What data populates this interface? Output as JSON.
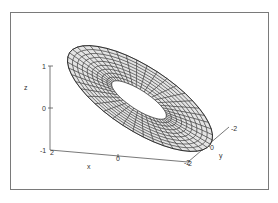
{
  "chart_data": {
    "type": "surface3d",
    "title": "",
    "xlabel": "x",
    "ylabel": "y",
    "zlabel": "z",
    "x_ticks": [
      "2",
      "0",
      "-2"
    ],
    "y_ticks": [
      "-2",
      "0",
      "2"
    ],
    "z_ticks": [
      "1",
      "0",
      "-1"
    ],
    "xlim": [
      -2,
      2
    ],
    "ylim": [
      -2,
      2
    ],
    "zlim": [
      -1,
      1
    ],
    "grid": false,
    "legend": null,
    "surface": {
      "fill_color": "#e4e4e4",
      "mesh_color": "#1a1a1a",
      "u_lines": 44,
      "v_lines": 9
    }
  },
  "colors": {
    "frame": "#7a7a7a",
    "axis": "#555555",
    "background": "#ffffff"
  }
}
